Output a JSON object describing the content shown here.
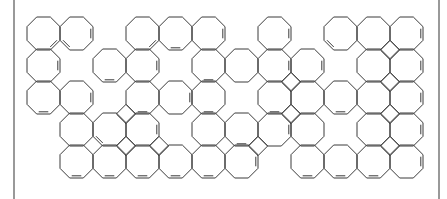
{
  "diagram": {
    "type": "chemical-structure",
    "colors": {
      "line": "#3a3a3a",
      "frame": "#555555",
      "background": "#ffffff"
    },
    "frame": {
      "left_x": 14,
      "right_x": 439
    },
    "grid": {
      "origin_x": 27,
      "origin_y": 17,
      "col_pitch": 33,
      "row_pitch": 32,
      "ring_size": 33
    },
    "rings": [
      [
        0,
        0
      ],
      [
        0,
        1
      ],
      [
        0,
        3
      ],
      [
        0,
        4
      ],
      [
        0,
        5
      ],
      [
        0,
        7
      ],
      [
        0,
        9
      ],
      [
        0,
        10
      ],
      [
        0,
        11
      ],
      [
        1,
        0
      ],
      [
        1,
        2
      ],
      [
        1,
        3
      ],
      [
        1,
        5
      ],
      [
        1,
        6
      ],
      [
        1,
        7
      ],
      [
        1,
        8
      ],
      [
        1,
        10
      ],
      [
        1,
        11
      ],
      [
        2,
        0
      ],
      [
        2,
        1
      ],
      [
        2,
        3
      ],
      [
        2,
        4
      ],
      [
        2,
        5
      ],
      [
        2,
        7
      ],
      [
        2,
        8
      ],
      [
        2,
        9
      ],
      [
        2,
        10
      ],
      [
        2,
        11
      ],
      [
        3,
        1
      ],
      [
        3,
        2
      ],
      [
        3,
        3
      ],
      [
        3,
        5
      ],
      [
        3,
        6
      ],
      [
        3,
        7
      ],
      [
        3,
        8
      ],
      [
        3,
        10
      ],
      [
        3,
        11
      ],
      [
        4,
        1
      ],
      [
        4,
        2
      ],
      [
        4,
        3
      ],
      [
        4,
        4
      ],
      [
        4,
        5
      ],
      [
        4,
        6
      ],
      [
        4,
        8
      ],
      [
        4,
        9
      ],
      [
        4,
        10
      ],
      [
        4,
        11
      ]
    ],
    "double_bonds": [
      [
        0,
        0,
        "br"
      ],
      [
        0,
        1,
        "r"
      ],
      [
        0,
        1,
        "bl"
      ],
      [
        0,
        3,
        "br"
      ],
      [
        0,
        4,
        "b"
      ],
      [
        0,
        5,
        "r"
      ],
      [
        0,
        7,
        "r"
      ],
      [
        0,
        9,
        "bl"
      ],
      [
        0,
        11,
        "r"
      ],
      [
        1,
        0,
        "r"
      ],
      [
        1,
        2,
        "b"
      ],
      [
        1,
        3,
        "r"
      ],
      [
        1,
        5,
        "b"
      ],
      [
        1,
        7,
        "r"
      ],
      [
        1,
        8,
        "r"
      ],
      [
        1,
        11,
        "r"
      ],
      [
        2,
        0,
        "b"
      ],
      [
        2,
        1,
        "r"
      ],
      [
        2,
        3,
        "b"
      ],
      [
        2,
        4,
        "r"
      ],
      [
        2,
        5,
        "b"
      ],
      [
        2,
        7,
        "b"
      ],
      [
        2,
        9,
        "b"
      ],
      [
        2,
        11,
        "r"
      ],
      [
        3,
        2,
        "bl"
      ],
      [
        3,
        3,
        "r"
      ],
      [
        3,
        6,
        "b"
      ],
      [
        3,
        7,
        "r"
      ],
      [
        3,
        11,
        "r"
      ],
      [
        4,
        1,
        "b"
      ],
      [
        4,
        2,
        "b"
      ],
      [
        4,
        3,
        "b"
      ],
      [
        4,
        4,
        "b"
      ],
      [
        4,
        5,
        "b"
      ],
      [
        4,
        6,
        "r"
      ],
      [
        4,
        8,
        "b"
      ],
      [
        4,
        9,
        "b"
      ],
      [
        4,
        10,
        "b"
      ],
      [
        4,
        11,
        "r"
      ]
    ],
    "four_rings": [
      [
        2,
        2
      ],
      [
        3,
        2
      ],
      [
        3,
        3
      ],
      [
        3,
        6
      ],
      [
        2,
        7
      ],
      [
        1,
        7
      ],
      [
        0,
        10
      ],
      [
        1,
        10
      ],
      [
        2,
        10
      ],
      [
        3,
        10
      ]
    ]
  }
}
